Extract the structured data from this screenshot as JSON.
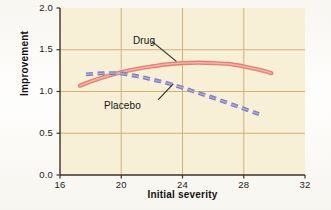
{
  "chart_data": {
    "type": "line",
    "title": "",
    "subtitle": "",
    "xlabel": "Initial severity",
    "ylabel": "Improvement",
    "xlim": [
      16,
      32
    ],
    "ylim": [
      0.0,
      2.0
    ],
    "xticks": [
      "16",
      "20",
      "24",
      "28",
      "32"
    ],
    "xtick_values": [
      16,
      20,
      24,
      28,
      32
    ],
    "yticks": [
      "0.0",
      "0.5",
      "1.0",
      "1.5",
      "2.0"
    ],
    "ytick_values": [
      0.0,
      0.5,
      1.0,
      1.5,
      2.0
    ],
    "grid": "both",
    "gridlines_x": [
      20,
      24,
      28
    ],
    "gridlines_y": [
      0.5,
      1.0,
      1.5
    ],
    "legend": "inline-annotations",
    "plot_background": "#F7F0D7",
    "grid_color": "#C8A96A",
    "axis_color": "#3A3326",
    "series": [
      {
        "name": "Drug",
        "style": "solid",
        "color": "#E07A6B",
        "highlight_color": "#F3B4A6",
        "x": [
          17.3,
          18.0,
          19.0,
          20.0,
          21.0,
          22.0,
          23.0,
          24.0,
          25.0,
          26.0,
          27.0,
          28.0,
          29.0,
          29.8
        ],
        "values": [
          1.07,
          1.12,
          1.18,
          1.23,
          1.27,
          1.3,
          1.325,
          1.34,
          1.345,
          1.34,
          1.33,
          1.3,
          1.26,
          1.22
        ]
      },
      {
        "name": "Placebo",
        "style": "dashed",
        "color": "#8180C4",
        "x": [
          17.7,
          18.5,
          19.3,
          20.0,
          21.0,
          22.0,
          23.0,
          24.0,
          25.0,
          26.0,
          27.0,
          28.0,
          29.0
        ],
        "values": [
          1.205,
          1.215,
          1.22,
          1.215,
          1.185,
          1.145,
          1.1,
          1.045,
          0.985,
          0.925,
          0.86,
          0.795,
          0.73
        ]
      }
    ],
    "annotations": [
      {
        "text": "Drug",
        "target_series": "Drug",
        "leader_from": [
          22.0,
          1.6
        ],
        "leader_to": [
          23.6,
          1.36
        ]
      },
      {
        "text": "Placebo",
        "target_series": "Placebo",
        "leader_from": [
          22.4,
          0.9
        ],
        "leader_to": [
          23.4,
          1.09
        ]
      }
    ]
  }
}
